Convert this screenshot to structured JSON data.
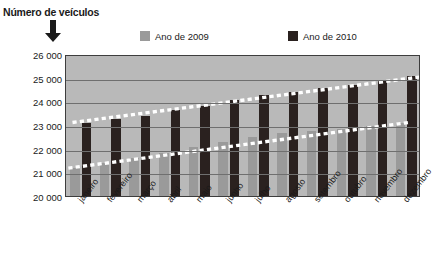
{
  "axis_title": "Número de veículos",
  "icons": {
    "arrow_down": "arrow-down-icon"
  },
  "legend": {
    "position": "top",
    "entries": [
      {
        "label": "Ano de 2009",
        "color": "#9a9a9a"
      },
      {
        "label": "Ano de 2010",
        "color": "#2a211f"
      }
    ]
  },
  "colors": {
    "plot_background": "#b9b9b9",
    "gridline": "#6f6f6f",
    "axis": "#3d3d3d",
    "series_2009": "#9a9a9a",
    "series_2010": "#2a211f",
    "trendline": "#ffffff"
  },
  "chart_data": {
    "type": "bar",
    "title": "Número de veículos",
    "xlabel": "",
    "ylabel": "Número de veículos",
    "categories": [
      "janeiro",
      "fevereiro",
      "março",
      "abril",
      "maio",
      "junho",
      "julho",
      "agosto",
      "setembro",
      "outubro",
      "novembro",
      "dezembro"
    ],
    "series": [
      {
        "name": "Ano de 2009",
        "color": "#9a9a9a",
        "values": [
          21200,
          21400,
          21600,
          21800,
          22050,
          22300,
          22500,
          22650,
          22750,
          22850,
          22950,
          23100
        ]
      },
      {
        "name": "Ano de 2010",
        "color": "#2a211f",
        "values": [
          23100,
          23250,
          23400,
          23650,
          23800,
          24050,
          24250,
          24400,
          24550,
          24700,
          24850,
          25050
        ]
      }
    ],
    "trendlines": [
      {
        "name": "Tendência 2009",
        "style": "dotted",
        "color": "#ffffff",
        "start": 21150,
        "end": 23150
      },
      {
        "name": "Tendência 2010",
        "style": "dotted",
        "color": "#ffffff",
        "start": 23150,
        "end": 25100
      }
    ],
    "ylim": [
      20000,
      26000
    ],
    "yticks": [
      26000,
      25000,
      24000,
      23000,
      22000,
      21000,
      20000
    ],
    "ytick_labels": [
      "26 000",
      "25 000",
      "24 000",
      "23 000",
      "22 000",
      "21 000",
      "20 000"
    ],
    "grid": true,
    "legend_position": "top"
  }
}
